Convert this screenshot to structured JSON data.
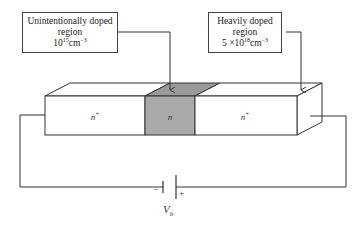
{
  "figure": {
    "type": "semiconductor n+/n/n+ structure with bias source",
    "colors": {
      "line": "#333333",
      "n_region_fill": "#a9a9a9",
      "n_region_top_fill": "#9a9a9a",
      "n_plus_fill": "#ffffff"
    }
  },
  "callouts": {
    "unintentional": {
      "line1": "Unintentionally doped",
      "line2": "region",
      "value_base": "10",
      "value_exp": "15",
      "value_unit": "cm",
      "value_unit_exp": "−3"
    },
    "heavy": {
      "line1": "Heavily doped",
      "line2": "region",
      "value_prefix": "5 ×10",
      "value_exp": "18",
      "value_unit": "cm",
      "value_unit_exp": "−3"
    }
  },
  "regions": [
    {
      "name": "left-n-plus",
      "base": "n",
      "sup": "+"
    },
    {
      "name": "middle-n",
      "base": "n",
      "sup": ""
    },
    {
      "name": "right-n-plus",
      "base": "n",
      "sup": "+"
    }
  ],
  "battery": {
    "minus": "−",
    "plus": "+",
    "label_base": "V",
    "label_sub": "b"
  }
}
